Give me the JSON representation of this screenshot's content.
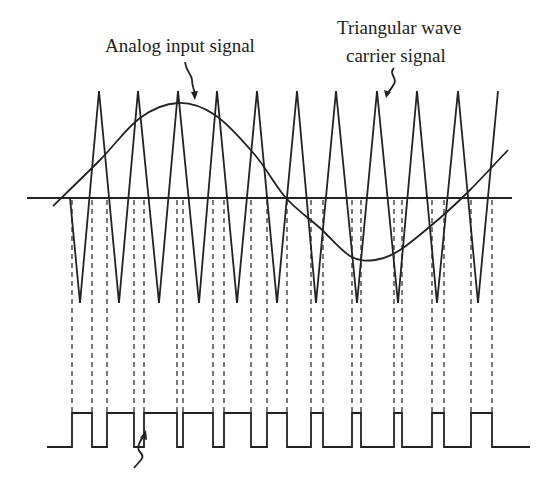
{
  "labels": {
    "analog": "Analog input signal",
    "carrier_line1": "Triangular wave",
    "carrier_line2": "carrier signal"
  },
  "colors": {
    "stroke": "#222222",
    "background": "#ffffff"
  },
  "diagram": {
    "type": "pwm-generation",
    "upper_baseline_y": 198,
    "carrier": {
      "peak_y": 91,
      "trough_y": 303,
      "points": [
        [
          70,
          198
        ],
        [
          80,
          303
        ],
        [
          99,
          91
        ],
        [
          119,
          303
        ],
        [
          138,
          91
        ],
        [
          159,
          303
        ],
        [
          178,
          91
        ],
        [
          199,
          303
        ],
        [
          217,
          91
        ],
        [
          237,
          303
        ],
        [
          257,
          91
        ],
        [
          277,
          303
        ],
        [
          297,
          91
        ],
        [
          316,
          303
        ],
        [
          336,
          91
        ],
        [
          357,
          303
        ],
        [
          377,
          91
        ],
        [
          398,
          303
        ],
        [
          417,
          91
        ],
        [
          437,
          303
        ],
        [
          458,
          91
        ],
        [
          478,
          303
        ],
        [
          498,
          91
        ]
      ]
    },
    "analog_signal": {
      "points": [
        [
          53,
          206
        ],
        [
          100,
          160
        ],
        [
          140,
          118
        ],
        [
          178,
          103
        ],
        [
          215,
          115
        ],
        [
          255,
          155
        ],
        [
          286,
          198
        ],
        [
          320,
          228
        ],
        [
          350,
          256
        ],
        [
          375,
          260
        ],
        [
          400,
          250
        ],
        [
          440,
          218
        ],
        [
          470,
          190
        ],
        [
          508,
          150
        ]
      ]
    },
    "pulse_train": {
      "baseline_y": 447,
      "high_y": 413,
      "baseline_x": [
        47,
        530
      ],
      "pulses": [
        [
          72,
          92
        ],
        [
          107,
          134
        ],
        [
          144,
          177
        ],
        [
          183,
          213
        ],
        [
          224,
          251
        ],
        [
          267,
          287
        ],
        [
          311,
          323
        ],
        [
          352,
          361
        ],
        [
          394,
          402
        ],
        [
          432,
          444
        ],
        [
          471,
          492
        ]
      ]
    }
  }
}
